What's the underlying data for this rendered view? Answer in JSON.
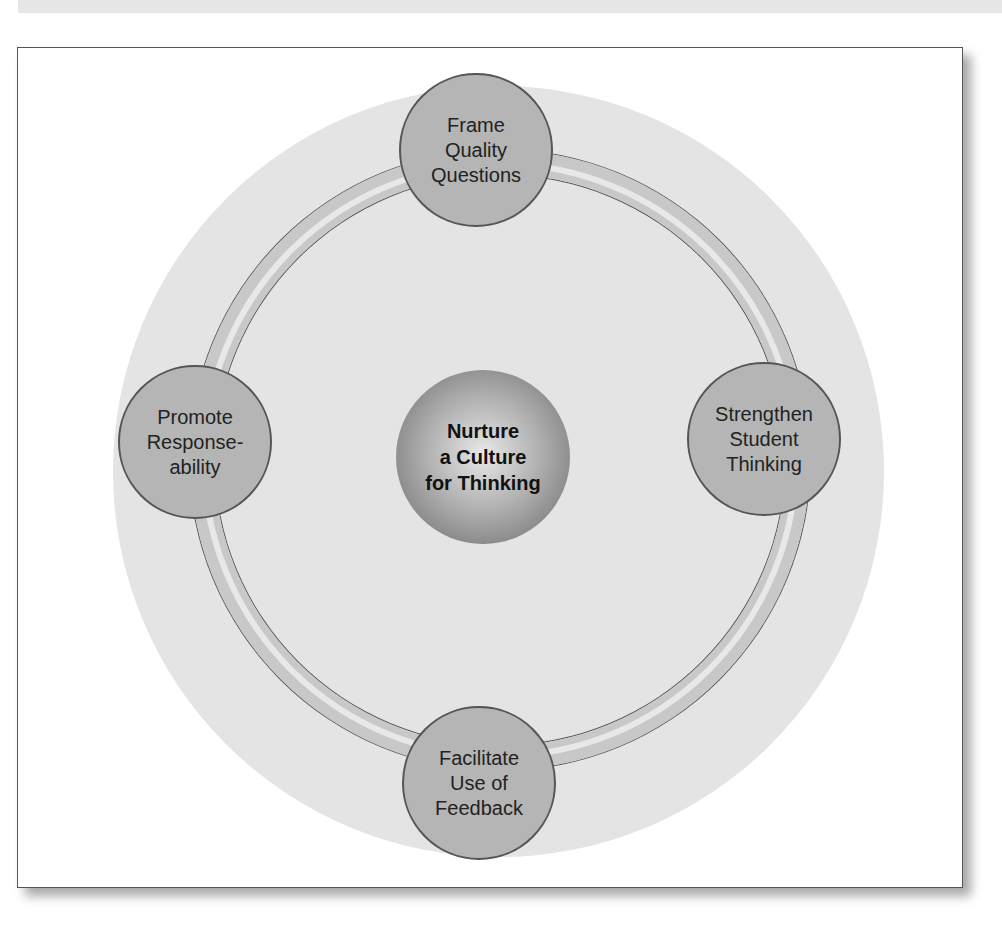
{
  "diagram": {
    "center": {
      "label": "Nurture\na Culture\nfor Thinking"
    },
    "nodes": [
      {
        "position": "top",
        "label": "Frame\nQuality\nQuestions"
      },
      {
        "position": "right",
        "label": "Strengthen\nStudent\nThinking"
      },
      {
        "position": "bottom",
        "label": "Facilitate\nUse of\nFeedback"
      },
      {
        "position": "left",
        "label": "Promote\nResponse-\nability"
      }
    ]
  }
}
